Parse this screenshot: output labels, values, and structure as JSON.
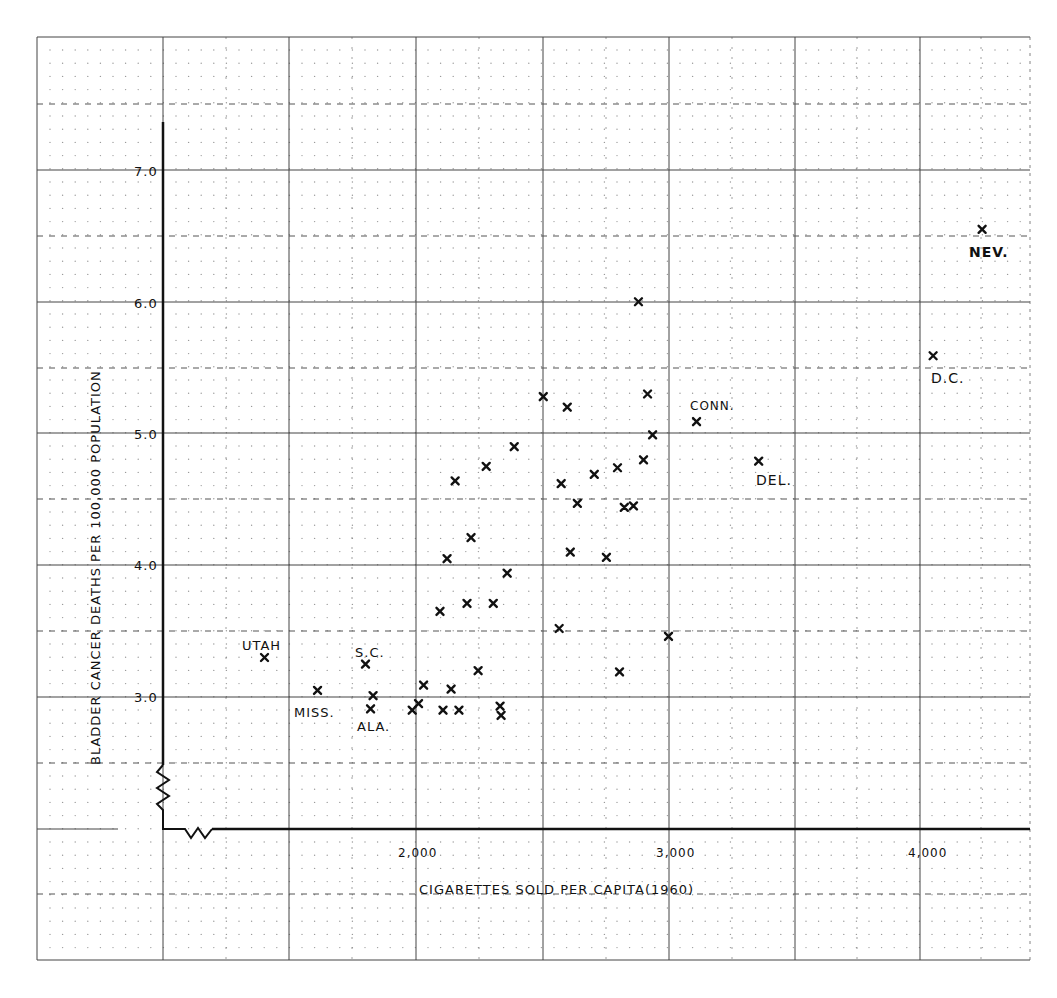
{
  "chart_data": {
    "type": "scatter",
    "title": "",
    "xlabel": "CIGARETTES SOLD PER CAPITA(1960)",
    "ylabel": "BLADDER CANCER DEATHS PER 100,000 POPULATION",
    "x_ticks": [
      {
        "value": 2000,
        "label": "2,000"
      },
      {
        "value": 3000,
        "label": "3,000"
      },
      {
        "value": 4000,
        "label": "4,000"
      }
    ],
    "y_ticks": [
      {
        "value": 3.0,
        "label": "3.0"
      },
      {
        "value": 4.0,
        "label": "4.0"
      },
      {
        "value": 5.0,
        "label": "5.0"
      },
      {
        "value": 6.0,
        "label": "6.0"
      },
      {
        "value": 7.0,
        "label": "7.0"
      }
    ],
    "xlim": [
      1000,
      4400
    ],
    "ylim": [
      2.0,
      7.5
    ],
    "axis_breaks": [
      "x",
      "y"
    ],
    "grid": true,
    "legend": null,
    "marker": "x",
    "points": [
      {
        "x": 1400,
        "y": 3.3,
        "label": "UTAH"
      },
      {
        "x": 1610,
        "y": 3.05,
        "label": "MISS."
      },
      {
        "x": 1800,
        "y": 3.25,
        "label": "S.C."
      },
      {
        "x": 1820,
        "y": 2.91,
        "label": "ALA."
      },
      {
        "x": 1830,
        "y": 3.01,
        "label": ""
      },
      {
        "x": 1985,
        "y": 2.9,
        "label": ""
      },
      {
        "x": 2010,
        "y": 2.95,
        "label": ""
      },
      {
        "x": 2030,
        "y": 3.09,
        "label": ""
      },
      {
        "x": 2107,
        "y": 2.9,
        "label": ""
      },
      {
        "x": 2139,
        "y": 3.06,
        "label": ""
      },
      {
        "x": 2170,
        "y": 2.9,
        "label": ""
      },
      {
        "x": 2246,
        "y": 3.2,
        "label": ""
      },
      {
        "x": 2333,
        "y": 2.93,
        "label": ""
      },
      {
        "x": 2337,
        "y": 2.86,
        "label": ""
      },
      {
        "x": 2095,
        "y": 3.65,
        "label": ""
      },
      {
        "x": 2202,
        "y": 3.71,
        "label": ""
      },
      {
        "x": 2306,
        "y": 3.71,
        "label": ""
      },
      {
        "x": 2361,
        "y": 3.94,
        "label": ""
      },
      {
        "x": 2123,
        "y": 4.05,
        "label": ""
      },
      {
        "x": 2218,
        "y": 4.21,
        "label": ""
      },
      {
        "x": 2155,
        "y": 4.64,
        "label": ""
      },
      {
        "x": 2278,
        "y": 4.75,
        "label": ""
      },
      {
        "x": 2389,
        "y": 4.9,
        "label": ""
      },
      {
        "x": 2504,
        "y": 5.28,
        "label": ""
      },
      {
        "x": 2599,
        "y": 5.2,
        "label": ""
      },
      {
        "x": 2567,
        "y": 3.52,
        "label": ""
      },
      {
        "x": 2575,
        "y": 4.62,
        "label": ""
      },
      {
        "x": 2611,
        "y": 4.1,
        "label": ""
      },
      {
        "x": 2639,
        "y": 4.47,
        "label": ""
      },
      {
        "x": 2706,
        "y": 4.69,
        "label": ""
      },
      {
        "x": 2754,
        "y": 4.06,
        "label": ""
      },
      {
        "x": 2798,
        "y": 4.74,
        "label": ""
      },
      {
        "x": 2806,
        "y": 3.19,
        "label": ""
      },
      {
        "x": 2825,
        "y": 4.44,
        "label": ""
      },
      {
        "x": 2861,
        "y": 4.45,
        "label": ""
      },
      {
        "x": 2881,
        "y": 6.0,
        "label": ""
      },
      {
        "x": 2901,
        "y": 4.8,
        "label": ""
      },
      {
        "x": 2917,
        "y": 5.3,
        "label": ""
      },
      {
        "x": 2937,
        "y": 4.99,
        "label": ""
      },
      {
        "x": 3000,
        "y": 3.46,
        "label": ""
      },
      {
        "x": 3111,
        "y": 5.09,
        "label": "CONN."
      },
      {
        "x": 3357,
        "y": 4.79,
        "label": "DEL."
      },
      {
        "x": 4048,
        "y": 5.59,
        "label": "D.C."
      },
      {
        "x": 4242,
        "y": 6.55,
        "label": "NEV."
      }
    ],
    "annotations": [
      {
        "text": "UTAH",
        "x": 1400,
        "y": 3.3
      },
      {
        "text": "MISS.",
        "x": 1610,
        "y": 3.05
      },
      {
        "text": "S.C.",
        "x": 1800,
        "y": 3.25
      },
      {
        "text": "ALA.",
        "x": 1820,
        "y": 2.91
      },
      {
        "text": "CONN.",
        "x": 3111,
        "y": 5.09
      },
      {
        "text": "DEL.",
        "x": 3357,
        "y": 4.79
      },
      {
        "text": "D.C.",
        "x": 4048,
        "y": 5.59
      },
      {
        "text": "NEV.",
        "x": 4242,
        "y": 6.55
      }
    ]
  },
  "labels": {
    "xlabel": "CIGARETTES SOLD PER CAPITA(1960)",
    "ylabel": "BLADDER CANCER DEATHS PER 100,000 POPULATION",
    "x2000": "2,000",
    "x3000": "3,000",
    "x4000": "4,000",
    "y3": "3.0",
    "y4": "4.0",
    "y5": "5.0",
    "y6": "6.0",
    "y7": "7.0",
    "utah": "UTAH",
    "miss": "MISS.",
    "sc": "S.C.",
    "ala": "ALA.",
    "conn": "CONN.",
    "del": "DEL.",
    "dc": "D.C.",
    "nev": "NEV."
  },
  "colors": {
    "ink": "#111111",
    "grid": "#333333",
    "dots": "#777777",
    "paper": "#ffffff"
  }
}
